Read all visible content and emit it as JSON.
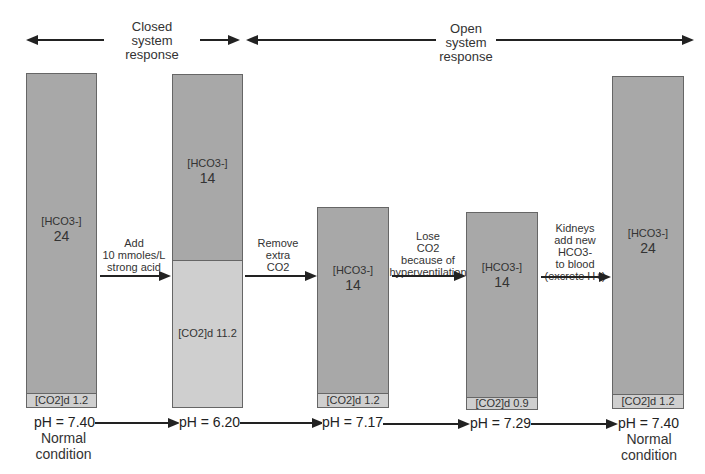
{
  "headers": {
    "closed": {
      "line1": "Closed",
      "line2": "system",
      "line3": "response"
    },
    "open": {
      "line1": "Open",
      "line2": "system",
      "line3": "response"
    }
  },
  "columns": [
    {
      "hco3_label": "[HCO3-]",
      "hco3_value": "24",
      "co2_label": "[CO2]d",
      "co2_value": "1.2",
      "ph": "pH = 7.40",
      "note_line1": "Normal",
      "note_line2": "condition"
    },
    {
      "hco3_label": "[HCO3-]",
      "hco3_value": "14",
      "co2_label": "[CO2]d",
      "co2_value": "11.2",
      "ph": "pH = 6.20"
    },
    {
      "hco3_label": "[HCO3-]",
      "hco3_value": "14",
      "co2_label": "[CO2]d",
      "co2_value": "1.2",
      "ph": "pH = 7.17"
    },
    {
      "hco3_label": "[HCO3-]",
      "hco3_value": "14",
      "co2_label": "[CO2]d",
      "co2_value": "0.9",
      "ph": "pH = 7.29"
    },
    {
      "hco3_label": "[HCO3-]",
      "hco3_value": "24",
      "co2_label": "[CO2]d",
      "co2_value": "1.2",
      "ph": "pH = 7.40",
      "note_line1": "Normal",
      "note_line2": "condition"
    }
  ],
  "steps": [
    {
      "line1": "Add",
      "line2": "10 mmoles/L",
      "line3": "strong acid"
    },
    {
      "line1": "Remove",
      "line2": "extra",
      "line3": "CO2"
    },
    {
      "line1": "Lose",
      "line2": "CO2",
      "line3": "because of",
      "line4": "hyperventilation"
    },
    {
      "line1": "Kidneys",
      "line2": "add new",
      "line3": "HCO3-",
      "line4": "to blood",
      "line5": "(excrete H+)"
    }
  ],
  "colors": {
    "bicarbonate_bar": "#a8a8a8",
    "co2_bar": "#cfcfcf",
    "arrow": "#222222"
  }
}
